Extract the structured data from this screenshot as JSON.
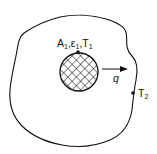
{
  "diagram": {
    "body_label": {
      "main": "A",
      "sub": "1",
      "sep1": ",",
      "eps": "ε",
      "eps_sub": "1",
      "sep2": ",",
      "t": "T",
      "t_sub": "1"
    },
    "flux_label": "q",
    "enclosure_label": {
      "main": "T",
      "sub": "2"
    },
    "colors": {
      "stroke": "#111111",
      "background": "#ffffff"
    }
  }
}
